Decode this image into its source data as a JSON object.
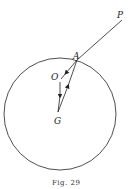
{
  "figure": {
    "caption": "Fig. 29",
    "labels": {
      "P": "P",
      "A": "A",
      "O": "O",
      "G": "G"
    },
    "circle": {
      "cx": 60,
      "cy": 114,
      "r": 56
    },
    "points": {
      "P": [
        122,
        20
      ],
      "A": [
        77,
        60
      ],
      "O": [
        60,
        80
      ],
      "G": [
        58,
        112
      ]
    },
    "stroke_color": "#222222"
  }
}
